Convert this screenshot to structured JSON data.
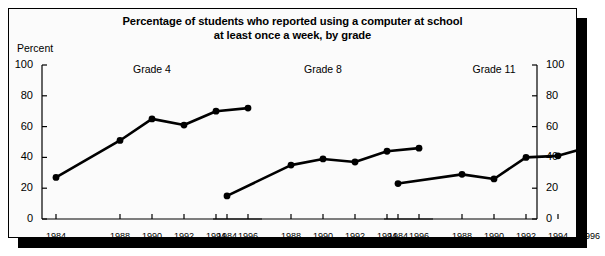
{
  "title": {
    "line1": "Percentage of students who reported using a computer at school",
    "line2": "at least once a week, by grade"
  },
  "axis": {
    "y_label": "Percent",
    "y_ticks": [
      "0",
      "20",
      "40",
      "60",
      "80",
      "100"
    ]
  },
  "panels": [
    {
      "label": "Grade 4"
    },
    {
      "label": "Grade 8"
    },
    {
      "label": "Grade 11"
    }
  ],
  "colors": {
    "line": "#000000",
    "marker": "#000000",
    "frame": "#000000",
    "background": "#fbfbfb",
    "shadow": "#000000"
  },
  "chart_data": {
    "type": "line",
    "title": "Percentage of students who reported using a computer at school at least once a week, by grade",
    "xlabel": "",
    "ylabel": "Percent",
    "ylim": [
      0,
      100
    ],
    "yticks": [
      0,
      20,
      40,
      60,
      80,
      100
    ],
    "grid": false,
    "legend": "none",
    "panel_layout": "three side-by-side panels sharing one y-axis scale",
    "x": [
      1984,
      1988,
      1990,
      1992,
      1994,
      1996
    ],
    "xticklabels": [
      "1984",
      "1988",
      "1990",
      "1992",
      "1994",
      "1996"
    ],
    "series": [
      {
        "name": "Grade 4",
        "values": [
          27,
          51,
          65,
          61,
          70,
          72
        ]
      },
      {
        "name": "Grade 8",
        "values": [
          15,
          35,
          39,
          37,
          44,
          46
        ]
      },
      {
        "name": "Grade 11",
        "values": [
          23,
          29,
          26,
          40,
          41,
          47
        ]
      }
    ]
  }
}
